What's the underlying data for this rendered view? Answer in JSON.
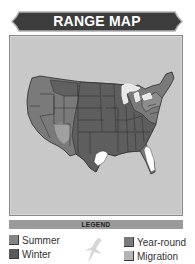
{
  "header": {
    "title": "RANGE MAP"
  },
  "map": {
    "region": "Contiguous United States",
    "background_color": "#c8c8c8",
    "colors": {
      "summer": "#808080",
      "winter": "#5e5e5e",
      "year_round": "#6e6e6e",
      "migration": "#a6a6a6",
      "out_of_range": "#ffffff",
      "great_lakes": "#e8e8e8"
    }
  },
  "legend": {
    "title": "LEGEND",
    "items": [
      {
        "label": "Summer",
        "color": "#858585"
      },
      {
        "label": "Winter",
        "color": "#5a5a5a"
      },
      {
        "label": "Year-round",
        "color": "#7a7a7a"
      },
      {
        "label": "Migration",
        "color": "#b4b4b4"
      }
    ],
    "icon": "bird-silhouette-icon"
  }
}
